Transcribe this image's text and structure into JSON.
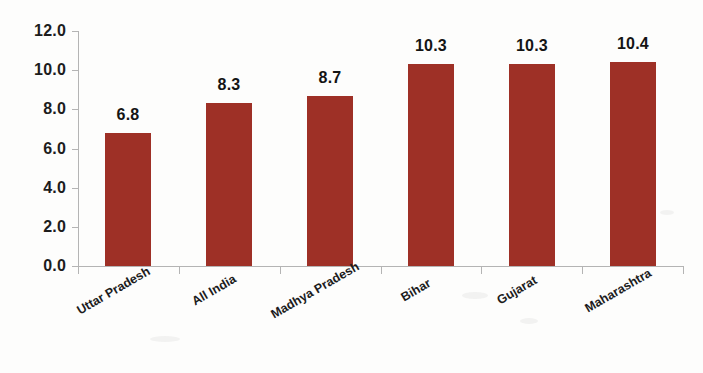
{
  "chart_data": {
    "type": "bar",
    "title": "",
    "subtitle": "",
    "xlabel": "",
    "ylabel": "",
    "categories": [
      "Uttar Pradesh",
      "All India",
      "Madhya Pradesh",
      "Bihar",
      "Gujarat",
      "Maharashtra"
    ],
    "values": [
      6.8,
      8.3,
      8.7,
      10.3,
      10.3,
      10.4
    ],
    "value_labels": [
      "6.8",
      "8.3",
      "8.7",
      "10.3",
      "10.3",
      "10.4"
    ],
    "ylim": [
      0.0,
      12.0
    ],
    "ytick_values": [
      0.0,
      2.0,
      4.0,
      6.0,
      8.0,
      10.0,
      12.0
    ],
    "ytick_labels": [
      "0.0",
      "2.0",
      "4.0",
      "6.0",
      "8.0",
      "10.0",
      "12.0"
    ],
    "grid": false,
    "legend": null,
    "legend_position": "none",
    "series": [
      {
        "name": "",
        "values": [
          6.8,
          8.3,
          8.7,
          10.3,
          10.3,
          10.4
        ],
        "color": "#9E3026"
      }
    ],
    "bar_color": "#9E3026",
    "axis_color": "#B4B4B4",
    "text_color": "#1C1C1C",
    "background_color": "#FDFDFC",
    "category_label_rotation_deg": -30
  }
}
